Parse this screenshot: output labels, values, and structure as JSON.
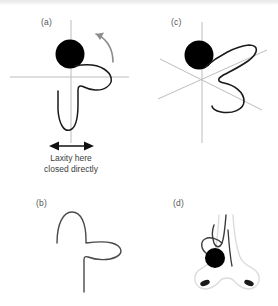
{
  "figure": {
    "background_color": "#ffffff",
    "width": 278,
    "height": 306
  },
  "panels": [
    {
      "key": "a",
      "label": "(a)",
      "description": "Deformed septal cartilage on orthogonal axes with black circular marker and curved rotation arrow",
      "has_axes": true,
      "axes_type": "orthogonal",
      "marker_color": "#000000",
      "curve_color": "#1a1a1a",
      "axis_color": "#b9b9b9"
    },
    {
      "key": "b",
      "label": "(b)",
      "description": "Isolated cartilage outline without axes",
      "has_axes": false,
      "curve_color": "#4a4a4a"
    },
    {
      "key": "c",
      "label": "(c)",
      "description": "Cartilage shown on three-axis oblique coordinate frame with black circular marker",
      "has_axes": true,
      "axes_type": "three-axis-oblique",
      "marker_color": "#000000",
      "curve_color": "#1a1a1a",
      "axis_color": "#b9b9b9"
    },
    {
      "key": "d",
      "label": "(d)",
      "description": "Cartilage overlaid on a faint nose outline with nostrils and black circular marker",
      "has_axes": false,
      "outline_color": "#d8d8d8",
      "marker_color": "#000000",
      "curve_color": "#3a3a3a"
    }
  ],
  "annotations": {
    "laxity_arrow": {
      "name": "double-headed-arrow",
      "orientation": "horizontal",
      "color": "#111111"
    },
    "rotation_arrow": {
      "name": "curved-rotation-arrow",
      "direction": "counter-clockwise",
      "color": "#8c8c8c"
    },
    "caption": {
      "line1": "Laxity here",
      "line2": "closed directly"
    }
  }
}
